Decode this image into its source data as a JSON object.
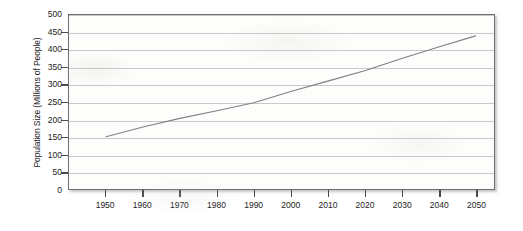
{
  "chart_data": {
    "type": "line",
    "title": "",
    "xlabel": "",
    "ylabel": "Population Size (Millions of People)",
    "xlim": [
      1940,
      2055
    ],
    "ylim": [
      0,
      500
    ],
    "grid": true,
    "legend": "none",
    "x_ticks": [
      1950,
      1960,
      1970,
      1980,
      1990,
      2000,
      2010,
      2020,
      2030,
      2040,
      2050
    ],
    "y_ticks": [
      0,
      50,
      100,
      150,
      200,
      250,
      300,
      350,
      400,
      450,
      500
    ],
    "series": [
      {
        "name": "Population Size",
        "color": "#808080",
        "x": [
          1950,
          1960,
          1970,
          1980,
          1990,
          2000,
          2010,
          2020,
          2030,
          2040,
          2050
        ],
        "values": [
          150,
          178,
          203,
          225,
          248,
          280,
          310,
          340,
          375,
          408,
          440
        ]
      }
    ]
  },
  "axes": {
    "y_title": "Population Size (Millions of People)",
    "y_tick_labels": [
      "500",
      "450",
      "400",
      "350",
      "300",
      "250",
      "200",
      "150",
      "100",
      "50",
      "0"
    ],
    "x_tick_labels": [
      "1950",
      "1960",
      "1970",
      "1980",
      "1990",
      "2000",
      "2010",
      "2020",
      "2030",
      "2040",
      "2050"
    ]
  },
  "colors": {
    "line": "#808080",
    "grid": "#c9c9c9",
    "frame": "#6e6e6e",
    "plot_background": "#fdfdfc",
    "text": "#1c1c1c"
  }
}
